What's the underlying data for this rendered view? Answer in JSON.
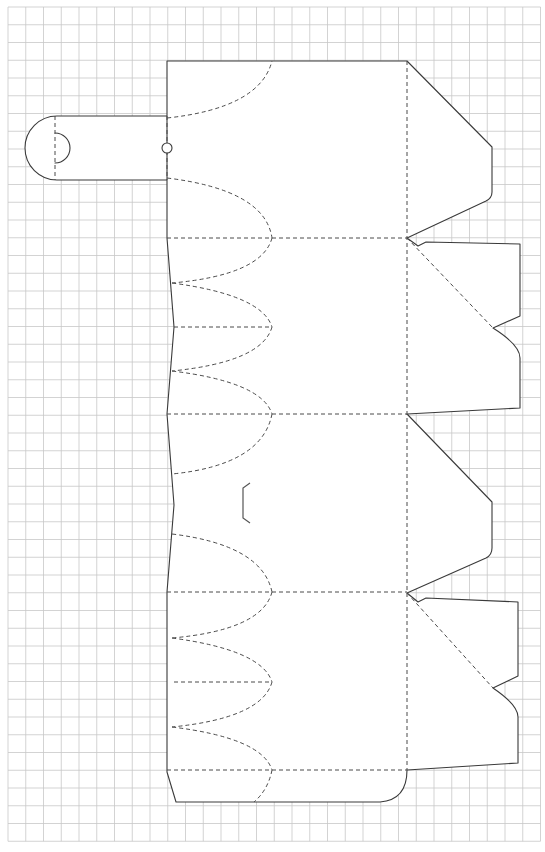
{
  "diagram": {
    "type": "box-dieline-template",
    "background": "#ffffff",
    "grid": {
      "color": "#c8c8c8",
      "x0": 8,
      "y0": 7,
      "cell": 17.75,
      "cols": 30,
      "rows": 47
    },
    "line_styles": {
      "cut": {
        "color": "#3a3a3a",
        "style": "solid"
      },
      "fold": {
        "color": "#4a4a4a",
        "style": "dashed"
      }
    },
    "parts": [
      {
        "name": "handle-tab",
        "kind": "cut",
        "desc": "rounded tab on left with half-circle slot"
      },
      {
        "name": "handle-hole",
        "kind": "cut",
        "desc": "small circle on tab fold line"
      },
      {
        "name": "main-body",
        "kind": "cut",
        "desc": "four wall panels stacked vertically with side flaps"
      },
      {
        "name": "wall-fold-lines",
        "kind": "fold",
        "count": 5
      },
      {
        "name": "bottom-petal-folds",
        "kind": "fold",
        "desc": "elliptical dashed curves forming closing petals"
      },
      {
        "name": "lock-slit",
        "kind": "cut",
        "desc": "bracket-shaped slit in third panel"
      },
      {
        "name": "top-flaps-right",
        "kind": "cut",
        "count": 4
      },
      {
        "name": "glue-flap-bottom",
        "kind": "cut"
      }
    ]
  }
}
